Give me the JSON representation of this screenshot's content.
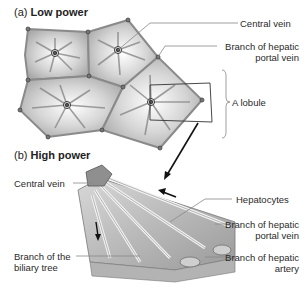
{
  "panel_a": {
    "prefix": "(a)",
    "title": "Low power",
    "labels": {
      "central_vein": "Central vein",
      "portal_vein_line1": "Branch of hepatic",
      "portal_vein_line2": "portal vein",
      "lobule": "A lobule"
    }
  },
  "panel_b": {
    "prefix": "(b)",
    "title": "High power",
    "labels": {
      "central_vein": "Central vein",
      "hepatocytes": "Hepatocytes",
      "portal_vein_line1": "Branch of hepatic",
      "portal_vein_line2": "portal vein",
      "biliary_line1": "Branch of the",
      "biliary_line2": "biliary tree",
      "artery_line1": "Branch of hepatic",
      "artery_line2": "artery"
    }
  },
  "colors": {
    "lobule_fill": "#bdbdbd",
    "lobule_light": "#f2f2f2",
    "edge": "#8a8a8a",
    "text": "#2a2a2a"
  }
}
